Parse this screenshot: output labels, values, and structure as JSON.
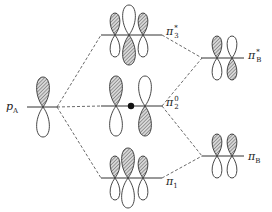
{
  "diagram": {
    "type": "molecular-orbital-diagram",
    "colors": {
      "line": "#333333",
      "shade": "#9a9a9a",
      "background": "#ffffff"
    },
    "left": {
      "label": {
        "main": "p",
        "sub": "A"
      },
      "level_y": 107
    },
    "center_levels": [
      {
        "id": "pi3star",
        "label": {
          "main": "π",
          "sup": "*",
          "sub": "3"
        },
        "level_y": 35
      },
      {
        "id": "pi2zero",
        "label": {
          "main": "π",
          "sup": "0",
          "sub": "2"
        },
        "level_y": 106
      },
      {
        "id": "pi1",
        "label": {
          "main": "π",
          "sub": "1"
        },
        "level_y": 178
      }
    ],
    "right_levels": [
      {
        "id": "piBstar",
        "label": {
          "main": "π",
          "sup": "*",
          "sub": "B"
        },
        "level_y": 58
      },
      {
        "id": "piB",
        "label": {
          "main": "π",
          "sub": "B"
        },
        "level_y": 156
      }
    ]
  }
}
